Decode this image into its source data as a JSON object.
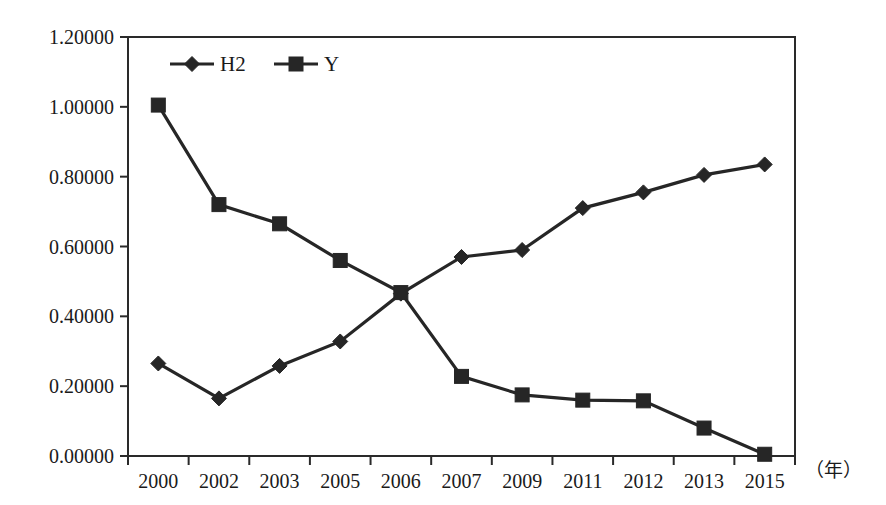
{
  "chart_data": {
    "type": "line",
    "title": "",
    "subtitle": "",
    "xlabel": "（年）",
    "ylabel": "",
    "categories": [
      "2000",
      "2002",
      "2003",
      "2005",
      "2006",
      "2007",
      "2009",
      "2011",
      "2012",
      "2013",
      "2015"
    ],
    "ylim": [
      0.0,
      1.2
    ],
    "y_ticks": [
      "0.00000",
      "0.20000",
      "0.40000",
      "0.60000",
      "0.80000",
      "1.00000",
      "1.20000"
    ],
    "y_tick_values": [
      0.0,
      0.2,
      0.4,
      0.6,
      0.8,
      1.0,
      1.2
    ],
    "grid": false,
    "legend_position": "top-left-inside",
    "series": [
      {
        "name": "H2",
        "marker": "diamond",
        "color": "#262626",
        "values": [
          0.265,
          0.165,
          0.258,
          0.328,
          0.465,
          0.57,
          0.59,
          0.71,
          0.755,
          0.805,
          0.835
        ]
      },
      {
        "name": "Y",
        "marker": "square",
        "color": "#262626",
        "values": [
          1.005,
          0.72,
          0.665,
          0.56,
          0.468,
          0.228,
          0.175,
          0.16,
          0.158,
          0.08,
          0.005
        ]
      }
    ]
  },
  "legend": {
    "entries": [
      {
        "label": "H2",
        "marker": "diamond-icon"
      },
      {
        "label": "Y",
        "marker": "square-icon"
      }
    ]
  },
  "axes": {
    "x_axis_unit_note": "（年）"
  }
}
